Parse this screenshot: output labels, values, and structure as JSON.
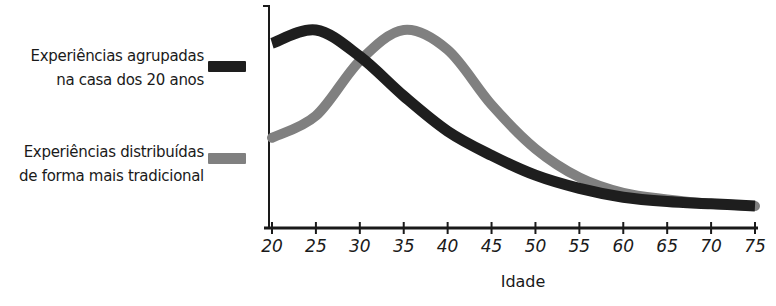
{
  "chart_data": {
    "type": "line",
    "title": "",
    "xlabel": "Idade",
    "ylabel": "",
    "x": [
      20,
      25,
      30,
      35,
      40,
      45,
      50,
      55,
      60,
      65,
      70,
      75
    ],
    "xticks": [
      "20",
      "25",
      "30",
      "35",
      "40",
      "45",
      "50",
      "55",
      "60",
      "65",
      "70",
      "75"
    ],
    "xlim": [
      20,
      75
    ],
    "ylim": [
      0,
      100
    ],
    "grid": false,
    "legend_position": "left",
    "series": [
      {
        "name": "Experiências agrupadas na casa dos 20 anos",
        "color": "#1e1e1e",
        "values": [
          84,
          90,
          78,
          60,
          44,
          33,
          24,
          18,
          14,
          12,
          11,
          10
        ]
      },
      {
        "name": "Experiências distribuídas de forma mais tradicional",
        "color": "#808080",
        "values": [
          41,
          51,
          76,
          90,
          81,
          56,
          36,
          23,
          16,
          13,
          11,
          10
        ]
      }
    ]
  },
  "legend": {
    "items": [
      {
        "line1": "Experiências agrupadas",
        "line2": "na casa dos 20 anos",
        "color": "#1e1e1e"
      },
      {
        "line1": "Experiências distribuídas",
        "line2": "de forma mais tradicional",
        "color": "#808080"
      }
    ]
  }
}
